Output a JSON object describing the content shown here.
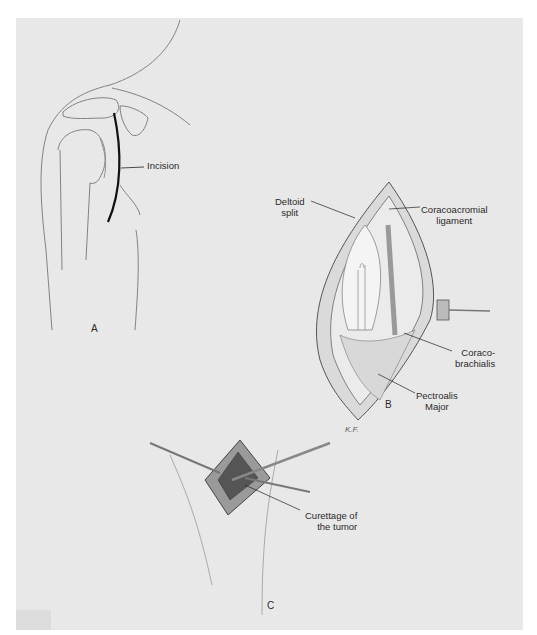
{
  "figure": {
    "panels": [
      {
        "id": "A",
        "description": "Shoulder outline with curved anterior incision line",
        "labels": [
          {
            "key": "incision",
            "text": "Incision"
          }
        ]
      },
      {
        "id": "B",
        "description": "Opened deltopectoral exposure held by retractor",
        "labels": [
          {
            "key": "deltoid_split",
            "lines": [
              "Deltoid",
              "split"
            ]
          },
          {
            "key": "coracoacromial_ligament",
            "lines": [
              "Coracoacromial",
              "ligament"
            ]
          },
          {
            "key": "coracobrachialis",
            "lines": [
              "Coraco-",
              "brachialis"
            ]
          },
          {
            "key": "pectoralis_major",
            "lines": [
              "Pectroalis",
              "Major"
            ]
          }
        ],
        "signature": "K.F."
      },
      {
        "id": "C",
        "description": "Window in proximal humerus with instruments",
        "labels": [
          {
            "key": "curettage",
            "lines": [
              "Curettage of",
              "the tumor"
            ]
          }
        ]
      }
    ]
  },
  "colors": {
    "background": "#e8e8e8",
    "border": "#ffffff",
    "ink": "#2a2a2a",
    "incision": "#111111"
  }
}
